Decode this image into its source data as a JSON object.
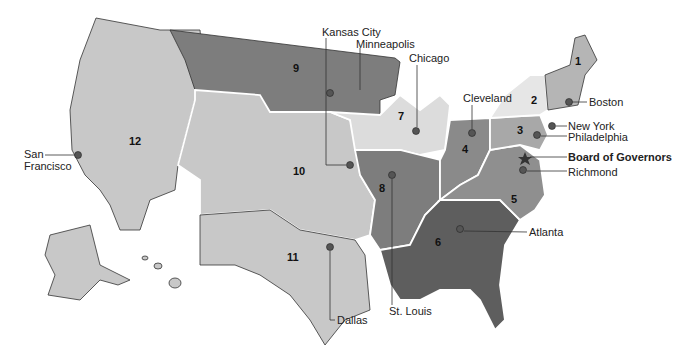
{
  "map": {
    "title": "Federal Reserve Districts",
    "districts": [
      {
        "number": "1",
        "city": "Boston"
      },
      {
        "number": "2",
        "city": "New York"
      },
      {
        "number": "3",
        "city": "Philadelphia"
      },
      {
        "number": "4",
        "city": "Cleveland"
      },
      {
        "number": "5",
        "city": "Richmond"
      },
      {
        "number": "6",
        "city": "Atlanta"
      },
      {
        "number": "7",
        "city": "Chicago"
      },
      {
        "number": "8",
        "city": "St. Louis"
      },
      {
        "number": "9",
        "city": "Minneapolis"
      },
      {
        "number": "10",
        "city": "Kansas City"
      },
      {
        "number": "11",
        "city": "Dallas"
      },
      {
        "number": "12",
        "city": "San Francisco"
      }
    ],
    "hq_label": "Board of Governors",
    "colors": {
      "light": "#c8c8c8",
      "lighter": "#dcdcdc",
      "medium": "#9a9a9a",
      "dark": "#767676",
      "darker": "#5e5e5e"
    }
  }
}
